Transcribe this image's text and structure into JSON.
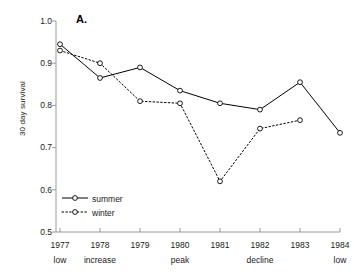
{
  "panel": {
    "letter": "A."
  },
  "axes": {
    "ylabel": "30 day survival",
    "yticks": [
      "1.0",
      "0.9",
      "0.8",
      "0.7",
      "0.6",
      "0.5"
    ],
    "xyears": [
      "1977",
      "1978",
      "1979",
      "1980",
      "1981",
      "1982",
      "1983",
      "1984"
    ],
    "xphases": [
      "low",
      "increase",
      "",
      "peak",
      "",
      "decline",
      "",
      "low"
    ]
  },
  "legend": {
    "items": [
      {
        "label": "summer",
        "style": "solid",
        "marker": "open-circle"
      },
      {
        "label": "winter",
        "style": "dotted",
        "marker": "open-circle"
      }
    ]
  },
  "chart_data": {
    "type": "line",
    "title": "",
    "xlabel": "",
    "ylabel": "30 day survival",
    "categories": [
      "1977",
      "1978",
      "1979",
      "1980",
      "1981",
      "1982",
      "1983",
      "1984"
    ],
    "category_phases": [
      "low",
      "increase",
      "",
      "peak",
      "",
      "decline",
      "",
      "low"
    ],
    "ylim": [
      0.5,
      1.0
    ],
    "yticks": [
      0.5,
      0.6,
      0.7,
      0.8,
      0.9,
      1.0
    ],
    "grid": false,
    "legend_position": "bottom-left",
    "series": [
      {
        "name": "summer",
        "linestyle": "solid",
        "marker": "open-circle",
        "color": "#000000",
        "values": [
          0.945,
          0.865,
          0.89,
          0.835,
          0.805,
          0.79,
          0.855,
          0.735
        ]
      },
      {
        "name": "winter",
        "linestyle": "dotted",
        "marker": "open-circle",
        "color": "#000000",
        "values": [
          0.93,
          0.9,
          0.81,
          0.805,
          0.62,
          0.745,
          0.765,
          null
        ]
      }
    ]
  }
}
